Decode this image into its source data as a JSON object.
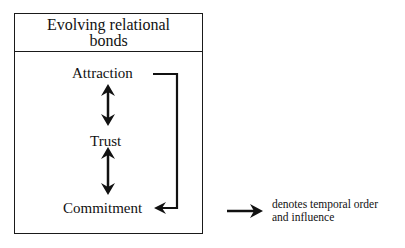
{
  "diagram": {
    "title_line1": "Evolving relational",
    "title_line2": "bonds",
    "nodes": [
      {
        "id": "attraction",
        "label": "Attraction"
      },
      {
        "id": "trust",
        "label": "Trust"
      },
      {
        "id": "commitment",
        "label": "Commitment"
      }
    ],
    "edges": [
      {
        "from": "attraction",
        "to": "trust",
        "type": "bidirectional"
      },
      {
        "from": "trust",
        "to": "commitment",
        "type": "bidirectional"
      },
      {
        "from": "attraction",
        "to": "commitment",
        "type": "directed"
      }
    ],
    "legend": {
      "line1": "denotes temporal order",
      "line2": "and influence",
      "symbol": "right-arrow"
    },
    "colors": {
      "ink": "#111111",
      "background": "#ffffff"
    }
  }
}
